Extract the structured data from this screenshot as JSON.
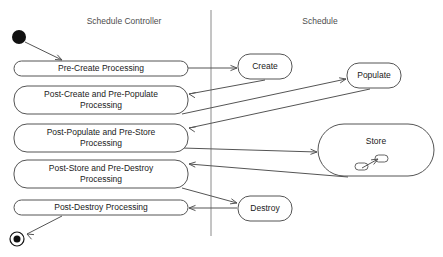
{
  "diagram": {
    "type": "uml-activity-diagram",
    "width": 443,
    "height": 257,
    "background_color": "#ffffff",
    "line_color": "#555555",
    "text_color": "#1a1a1a",
    "lane_title_color": "#4d4d4d",
    "divider_color": "#8a8a8a"
  },
  "lanes": [
    {
      "id": "lane-schedule-controller",
      "title": "Schedule Controller",
      "title_x": 124,
      "title_y": 22
    },
    {
      "id": "lane-schedule",
      "title": "Schedule",
      "title_x": 320,
      "title_y": 22
    }
  ],
  "divider": {
    "x": 211,
    "y1": 10,
    "y2": 236
  },
  "initial_node": {
    "cx": 19,
    "cy": 37,
    "r": 7
  },
  "final_node": {
    "cx": 17,
    "cy": 239,
    "r_outer": 7,
    "r_inner": 3.5
  },
  "nodes": [
    {
      "id": "pre-create-processing",
      "label": "Pre-Create Processing",
      "lines": [
        "Pre-Create Processing"
      ],
      "x": 14,
      "y": 61,
      "w": 174,
      "h": 15,
      "rx": 7.5,
      "lane": "lane-schedule-controller"
    },
    {
      "id": "post-create-and-pre-populate-processing",
      "label": "Post-Create and Pre-Populate Processing",
      "lines": [
        "Post-Create and Pre-Populate",
        "Processing"
      ],
      "x": 14,
      "y": 86,
      "w": 174,
      "h": 28,
      "rx": 13,
      "lane": "lane-schedule-controller"
    },
    {
      "id": "post-populate-and-pre-store-processing",
      "label": "Post-Populate and Pre-Store Processing",
      "lines": [
        "Post-Populate and Pre-Store",
        "Processing"
      ],
      "x": 14,
      "y": 124,
      "w": 174,
      "h": 28,
      "rx": 13,
      "lane": "lane-schedule-controller"
    },
    {
      "id": "post-store-and-pre-destroy-processing",
      "label": "Post-Store and Pre-Destroy Processing",
      "lines": [
        "Post-Store and Pre-Destroy",
        "Processing"
      ],
      "x": 14,
      "y": 160,
      "w": 174,
      "h": 28,
      "rx": 13,
      "lane": "lane-schedule-controller"
    },
    {
      "id": "post-destroy-processing",
      "label": "Post-Destroy Processing",
      "lines": [
        "Post-Destroy Processing"
      ],
      "x": 14,
      "y": 200,
      "w": 174,
      "h": 15,
      "rx": 7.5,
      "lane": "lane-schedule-controller"
    },
    {
      "id": "create",
      "label": "Create",
      "lines": [
        "Create"
      ],
      "x": 238,
      "y": 54,
      "w": 54,
      "h": 25,
      "rx": 12,
      "lane": "lane-schedule"
    },
    {
      "id": "populate",
      "label": "Populate",
      "lines": [
        "Populate"
      ],
      "x": 347,
      "y": 63,
      "w": 54,
      "h": 25,
      "rx": 12,
      "lane": "lane-schedule"
    },
    {
      "id": "store",
      "label": "Store",
      "lines": [
        "Store"
      ],
      "x": 318,
      "y": 124,
      "w": 116,
      "h": 52,
      "rx": 26,
      "lane": "lane-schedule",
      "has_subactivity_icon": true
    },
    {
      "id": "destroy",
      "label": "Destroy",
      "lines": [
        "Destroy"
      ],
      "x": 238,
      "y": 196,
      "w": 54,
      "h": 25,
      "rx": 12,
      "lane": "lane-schedule"
    }
  ],
  "subactivity_icon": {
    "id": "store-subactivity-icon",
    "left_box": {
      "x": 355,
      "y": 163,
      "w": 13,
      "h": 7,
      "rx": 3.5
    },
    "right_box": {
      "x": 375,
      "y": 155,
      "w": 13,
      "h": 7,
      "rx": 3.5
    },
    "connector": {
      "x1": 362,
      "y1": 168,
      "x2": 378,
      "y2": 159
    }
  },
  "flows": [
    {
      "id": "flow-initial-to-pre-create",
      "from": "initial_node",
      "to": "pre-create-processing",
      "x1": 25,
      "y1": 42,
      "x2": 62,
      "y2": 60,
      "head_angle_deg": 26
    },
    {
      "id": "flow-pre-create-to-create",
      "from": "pre-create-processing",
      "to": "create",
      "x1": 188,
      "y1": 68,
      "x2": 237,
      "y2": 68,
      "head_angle_deg": 0
    },
    {
      "id": "flow-create-to-post-create",
      "from": "create",
      "to": "post-create-and-pre-populate-processing",
      "x1": 265,
      "y1": 80,
      "x2": 189,
      "y2": 94,
      "head_angle_deg": 190
    },
    {
      "id": "flow-post-create-to-populate",
      "from": "post-create-and-pre-populate-processing",
      "to": "populate",
      "x1": 182,
      "y1": 114,
      "x2": 346,
      "y2": 79,
      "head_angle_deg": -12
    },
    {
      "id": "flow-populate-to-post-populate",
      "from": "populate",
      "to": "post-populate-and-pre-store-processing",
      "x1": 370,
      "y1": 89,
      "x2": 189,
      "y2": 128,
      "head_angle_deg": 192
    },
    {
      "id": "flow-post-populate-to-store",
      "from": "post-populate-and-pre-store-processing",
      "to": "store",
      "x1": 182,
      "y1": 148,
      "x2": 317,
      "y2": 152,
      "head_angle_deg": 2
    },
    {
      "id": "flow-store-to-post-store",
      "from": "store",
      "to": "post-store-and-pre-destroy-processing",
      "x1": 348,
      "y1": 177,
      "x2": 189,
      "y2": 164,
      "head_angle_deg": 185
    },
    {
      "id": "flow-post-store-to-destroy",
      "from": "post-store-and-pre-destroy-processing",
      "to": "destroy",
      "x1": 182,
      "y1": 188,
      "x2": 237,
      "y2": 203,
      "head_angle_deg": 15
    },
    {
      "id": "flow-destroy-to-post-destroy",
      "from": "destroy",
      "to": "post-destroy-processing",
      "x1": 237,
      "y1": 208,
      "x2": 189,
      "y2": 208,
      "head_angle_deg": 180
    },
    {
      "id": "flow-post-destroy-to-final",
      "from": "post-destroy-processing",
      "to": "final_node",
      "x1": 62,
      "y1": 216,
      "x2": 27,
      "y2": 234,
      "head_angle_deg": 207
    }
  ]
}
